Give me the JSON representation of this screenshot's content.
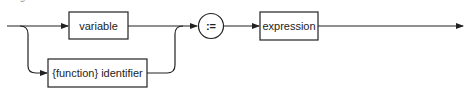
{
  "diagram": {
    "title": "assignment statement",
    "type": "syntax-diagram",
    "nodes": {
      "variable": {
        "label": "variable",
        "kind": "nonterminal"
      },
      "function_identifier": {
        "label": "{function} identifier",
        "kind": "nonterminal"
      },
      "assign_op": {
        "label": ":=",
        "kind": "terminal"
      },
      "expression": {
        "label": "expression",
        "kind": "nonterminal"
      }
    },
    "colors": {
      "line": "#222222",
      "box_fill": "#ffffff"
    }
  }
}
